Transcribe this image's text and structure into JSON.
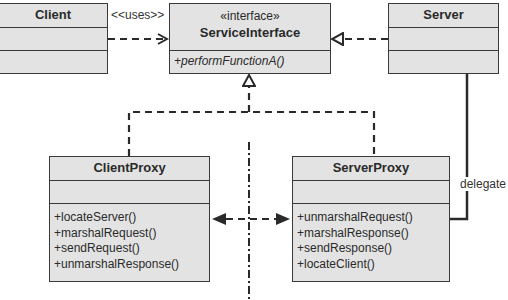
{
  "diagram": {
    "type": "UML class diagram",
    "pattern": "Proxy (Client/Server)"
  },
  "classes": {
    "client": {
      "name": "Client",
      "attributes": [],
      "operations": []
    },
    "service_interface": {
      "stereotype": "«interface»",
      "name": "ServiceInterface",
      "operations": [
        "+performFunctionA()"
      ]
    },
    "server": {
      "name": "Server",
      "attributes": [],
      "operations": []
    },
    "client_proxy": {
      "name": "ClientProxy",
      "attributes": [],
      "operations": [
        "+locateServer()",
        "+marshalRequest()",
        "+sendRequest()",
        "+unmarshalResponse()"
      ]
    },
    "server_proxy": {
      "name": "ServerProxy",
      "attributes": [],
      "operations": [
        "+unmarshalRequest()",
        "+marshalResponse()",
        "+sendResponse()",
        "+locateClient()"
      ]
    }
  },
  "relations": {
    "uses_label": "<<uses>>",
    "delegate_label": "delegate"
  },
  "colors": {
    "box_fill": "#e3e3e3",
    "line": "#3a3a3a"
  }
}
